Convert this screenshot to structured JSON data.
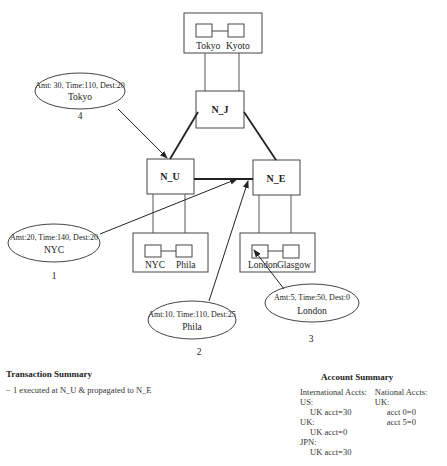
{
  "diagram": {
    "nodes": [
      {
        "id": "N_J",
        "label": "N_J"
      },
      {
        "id": "N_U",
        "label": "N_U"
      },
      {
        "id": "N_E",
        "label": "N_E"
      }
    ],
    "regions": [
      {
        "node": "N_J",
        "cities": [
          "Tokyo",
          "Kyoto"
        ]
      },
      {
        "node": "N_U",
        "cities": [
          "NYC",
          "Phila"
        ]
      },
      {
        "node": "N_E",
        "cities": [
          "London",
          "Glasgow"
        ]
      }
    ],
    "transactions": [
      {
        "number": "1",
        "details": "Amt:20, Time:140, Dest:20",
        "origin": "NYC"
      },
      {
        "number": "2",
        "details": "Amt:10, Time:110, Dest:25",
        "origin": "Phila"
      },
      {
        "number": "3",
        "details": "Amt:5, Time:50, Dest:0",
        "origin": "London"
      },
      {
        "number": "4",
        "details": "Amt: 30, Time:110, Dest:20",
        "origin": "Tokyo"
      }
    ]
  },
  "transaction_summary": {
    "title": "Transaction Summary",
    "items": [
      "− 1 executed at N_U & propagated to N_E"
    ]
  },
  "account_summary": {
    "title": "Account Summary",
    "international": {
      "header": "International Accts:",
      "groups": [
        {
          "label": "US:",
          "entries": [
            "UK acct=30"
          ]
        },
        {
          "label": "UK:",
          "entries": [
            "UK acct=0"
          ]
        },
        {
          "label": "JPN:",
          "entries": [
            "UK acct=30"
          ]
        }
      ]
    },
    "national": {
      "header": "National Accts:",
      "groups": [
        {
          "label": "UK:",
          "entries": [
            "acct 0=0",
            "acct 5=0"
          ]
        }
      ]
    }
  }
}
